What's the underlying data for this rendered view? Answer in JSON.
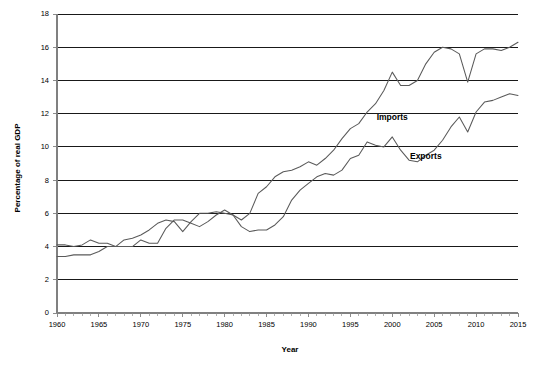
{
  "chart_data": {
    "type": "line",
    "title": "",
    "xlabel": "Year",
    "ylabel": "Percentage of real GDP",
    "xlim": [
      1960,
      2015
    ],
    "ylim": [
      0,
      18
    ],
    "grid": true,
    "grid_axis": "y",
    "legend_position": "inline-annotation",
    "ytick_labels": [
      "0",
      "2",
      "4",
      "6",
      "8",
      "10",
      "12",
      "14",
      "16",
      "18"
    ],
    "ytick_values": [
      0,
      2,
      4,
      6,
      8,
      10,
      12,
      14,
      16,
      18
    ],
    "xtick_labels": [
      "1960",
      "1965",
      "1970",
      "1975",
      "1980",
      "1985",
      "1990",
      "1995",
      "2000",
      "2005",
      "2010",
      "2015"
    ],
    "xtick_values": [
      1960,
      1965,
      1970,
      1975,
      1980,
      1985,
      1990,
      1995,
      2000,
      2005,
      2010,
      2015
    ],
    "x": [
      1960,
      1961,
      1962,
      1963,
      1964,
      1965,
      1966,
      1967,
      1968,
      1969,
      1970,
      1971,
      1972,
      1973,
      1974,
      1975,
      1976,
      1977,
      1978,
      1979,
      1980,
      1981,
      1982,
      1983,
      1984,
      1985,
      1986,
      1987,
      1988,
      1989,
      1990,
      1991,
      1992,
      1993,
      1994,
      1995,
      1996,
      1997,
      1998,
      1999,
      2000,
      2001,
      2002,
      2003,
      2004,
      2005,
      2006,
      2007,
      2008,
      2009,
      2010,
      2011,
      2012,
      2013,
      2014,
      2015
    ],
    "series": [
      {
        "name": "Imports",
        "color": "#5a5a5a",
        "label_x": 2000,
        "label_y": 11.6,
        "values": [
          3.4,
          3.4,
          3.5,
          3.5,
          3.5,
          3.7,
          4.0,
          4.0,
          4.4,
          4.5,
          4.7,
          5.0,
          5.4,
          5.6,
          5.5,
          4.9,
          5.5,
          6.0,
          6.0,
          6.1,
          6.0,
          5.9,
          5.6,
          6.0,
          7.2,
          7.6,
          8.2,
          8.5,
          8.6,
          8.8,
          9.1,
          8.9,
          9.3,
          9.8,
          10.5,
          11.1,
          11.4,
          12.1,
          12.6,
          13.4,
          14.5,
          13.7,
          13.7,
          14.0,
          15.0,
          15.7,
          16.0,
          15.9,
          15.6,
          13.9,
          15.6,
          15.9,
          15.9,
          15.8,
          16.0,
          16.3
        ]
      },
      {
        "name": "Exports",
        "color": "#5a5a5a",
        "label_x": 2004,
        "label_y": 9.3,
        "values": [
          4.1,
          4.1,
          4.0,
          4.1,
          4.4,
          4.2,
          4.2,
          4.0,
          4.0,
          4.0,
          4.4,
          4.2,
          4.2,
          5.1,
          5.6,
          5.6,
          5.4,
          5.2,
          5.5,
          5.9,
          6.2,
          5.9,
          5.2,
          4.9,
          5.0,
          5.0,
          5.3,
          5.8,
          6.8,
          7.4,
          7.8,
          8.2,
          8.4,
          8.3,
          8.6,
          9.3,
          9.5,
          10.3,
          10.1,
          10.0,
          10.6,
          9.8,
          9.2,
          9.1,
          9.5,
          9.8,
          10.4,
          11.2,
          11.8,
          10.9,
          12.1,
          12.7,
          12.8,
          13.0,
          13.2,
          13.1
        ]
      }
    ]
  }
}
